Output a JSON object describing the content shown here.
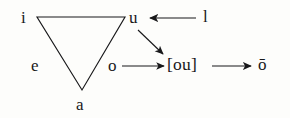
{
  "diagram": {
    "type": "vowel-triangle-sound-change",
    "canvas": {
      "width": 290,
      "height": 118
    },
    "background_color": "#fdfdfb",
    "ink_color": "#18181a",
    "triangle": {
      "name": "vowel-triangle",
      "vertices": [
        {
          "label": "i",
          "x": 37,
          "y": 17
        },
        {
          "label": "u",
          "x": 125,
          "y": 17
        },
        {
          "label": "a",
          "x": 82,
          "y": 90
        }
      ]
    },
    "labels": {
      "i": "i",
      "u": "u",
      "e": "e",
      "o": "o",
      "a": "a",
      "l": "l",
      "diphthong": "[ou]",
      "long_o": "ō"
    },
    "arrows": [
      {
        "name": "l-to-u",
        "from": "l",
        "to": "u",
        "direction": "left"
      },
      {
        "name": "u-to-diphthong",
        "from": "u",
        "to": "[ou]",
        "direction": "down-right"
      },
      {
        "name": "o-to-diphthong",
        "from": "o",
        "to": "[ou]",
        "direction": "right"
      },
      {
        "name": "diphthong-to-long-o",
        "from": "[ou]",
        "to": "ō",
        "direction": "right"
      }
    ]
  }
}
